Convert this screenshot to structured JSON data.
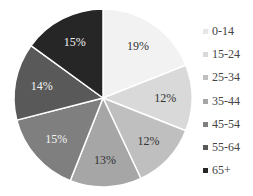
{
  "chart_data": {
    "type": "pie",
    "title": "",
    "categories": [
      "0-14",
      "15-24",
      "25-34",
      "35-44",
      "45-54",
      "55-64",
      "65+"
    ],
    "values": [
      19,
      12,
      12,
      13,
      15,
      14,
      15
    ],
    "labels": [
      "19%",
      "12%",
      "12%",
      "13%",
      "15%",
      "14%",
      "15%"
    ],
    "colors": [
      "#f2f2f2",
      "#d9d9d9",
      "#bfbfbf",
      "#a6a6a6",
      "#7f7f7f",
      "#595959",
      "#262626"
    ],
    "label_colors": [
      "#333333",
      "#333333",
      "#333333",
      "#333333",
      "#f2f2f2",
      "#f2f2f2",
      "#f2f2f2"
    ],
    "start_angle": "12 o'clock",
    "direction": "clockwise",
    "legend_position": "right"
  },
  "legend": {
    "items": [
      {
        "label": "0-14",
        "color": "#f2f2f2"
      },
      {
        "label": "15-24",
        "color": "#d9d9d9"
      },
      {
        "label": "25-34",
        "color": "#bfbfbf"
      },
      {
        "label": "35-44",
        "color": "#a6a6a6"
      },
      {
        "label": "45-54",
        "color": "#7f7f7f"
      },
      {
        "label": "55-64",
        "color": "#595959"
      },
      {
        "label": "65+",
        "color": "#262626"
      }
    ]
  }
}
